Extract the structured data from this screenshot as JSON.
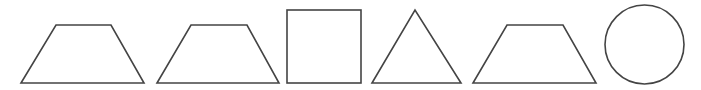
{
  "diagram": {
    "background": "#ffffff",
    "stroke_color": "#444444",
    "shapes": [
      {
        "id": "trapezoid-1",
        "type": "trapezoid",
        "points": "21,83 56,25 111,25 144,83"
      },
      {
        "id": "trapezoid-2",
        "type": "trapezoid",
        "points": "157,83 191,25 247,25 279,83"
      },
      {
        "id": "square-1",
        "type": "square",
        "x": 287,
        "y": 10,
        "width": 74,
        "height": 73
      },
      {
        "id": "triangle-1",
        "type": "triangle",
        "points": "372,83 415,10 461,83"
      },
      {
        "id": "trapezoid-3",
        "type": "trapezoid",
        "points": "473,83 507,25 563,25 596,83"
      },
      {
        "id": "circle-1",
        "type": "circle",
        "cx": 644.5,
        "cy": 44.5,
        "r": 39.5
      }
    ]
  }
}
